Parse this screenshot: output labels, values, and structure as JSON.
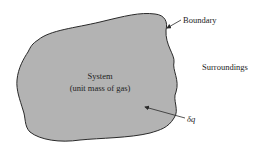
{
  "diagram": {
    "system_label": "System",
    "system_sublabel": "(unit mass of gas)",
    "boundary_label": "Boundary",
    "surroundings_label": "Surroundings",
    "heat_label": "δq",
    "colors": {
      "system_fill": "#b3b3b3",
      "outline": "#2a2a2a",
      "text": "#222222"
    }
  }
}
